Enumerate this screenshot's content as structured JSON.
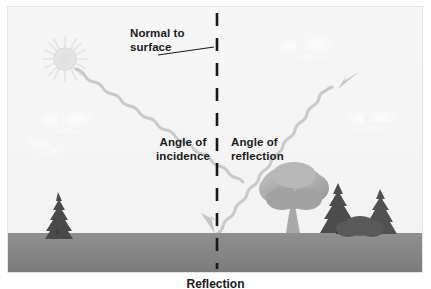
{
  "figure": {
    "caption": "Reflection"
  },
  "labels": {
    "normal_to_surface": "Normal to\nsurface",
    "angle_of_incidence": "Angle of\nincidence",
    "angle_of_reflection": "Angle of\nreflection"
  },
  "colors": {
    "sky": "#f4f4f4",
    "ground": "#8c8c8c",
    "ground_dark": "#7d7d7d",
    "ray": "#c9c9c9",
    "normal_line": "#1a1a1a",
    "text": "#1a1a1a",
    "sun": "#e2e2e2",
    "cloud": "#fbfbfb",
    "tree_deciduous": "#b0b0b0",
    "tree_conifer_dark": "#4f4f4f",
    "frame": "#e3e3e3"
  },
  "elements": {
    "sun": {
      "name": "sun",
      "cx": 57,
      "cy": 52,
      "r": 11
    },
    "normal_line": {
      "x": 209,
      "y_top": 8,
      "y_bottom": 262,
      "dash": 13,
      "gap": 12
    },
    "incident_ray": {
      "from": "sun",
      "to": "surface-point",
      "arrow": "down-right"
    },
    "reflected_ray": {
      "from": "surface-point",
      "to": "upper-right",
      "arrow": "up-right"
    },
    "surface_point": {
      "x": 209,
      "y": 226
    },
    "horizon_y": 226,
    "leader_line": {
      "x1": 152,
      "y1": 48,
      "x2": 205,
      "y2": 41
    }
  },
  "scenery": {
    "clouds": [
      {
        "name": "cloud-left-upper",
        "cx": 60,
        "cy": 118,
        "w": 66,
        "h": 18
      },
      {
        "name": "cloud-left-lower",
        "cx": 42,
        "cy": 140,
        "w": 58,
        "h": 15
      },
      {
        "name": "cloud-right-upper",
        "cx": 300,
        "cy": 44,
        "w": 70,
        "h": 18
      },
      {
        "name": "cloud-right-lower",
        "cx": 364,
        "cy": 117,
        "w": 62,
        "h": 16
      }
    ],
    "trees": [
      {
        "name": "conifer-left",
        "x": 50,
        "type": "conifer"
      },
      {
        "name": "deciduous-right",
        "x": 300,
        "type": "deciduous"
      },
      {
        "name": "conifer-right-a",
        "x": 348,
        "type": "conifer"
      },
      {
        "name": "conifer-right-b",
        "x": 385,
        "type": "conifer"
      }
    ]
  }
}
